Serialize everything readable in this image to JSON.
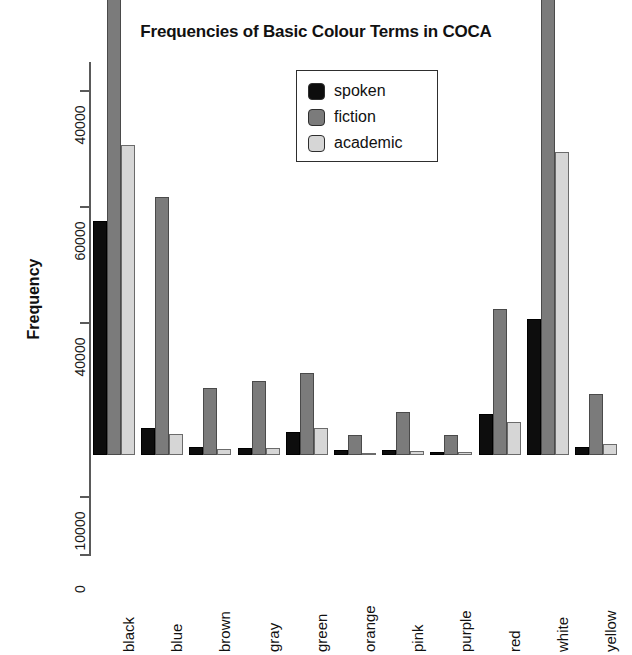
{
  "chart_data": {
    "type": "bar",
    "title": "Frequencies of Basic Colour Terms in COCA",
    "xlabel": "",
    "ylabel": "Frequency",
    "categories": [
      "black",
      "blue",
      "brown",
      "gray",
      "green",
      "orange",
      "pink",
      "purple",
      "red",
      "white",
      "yellow"
    ],
    "series": [
      {
        "name": "spoken",
        "color": "#0d0d0d",
        "values": [
          40300,
          4700,
          1300,
          1250,
          3900,
          900,
          950,
          550,
          7100,
          23500,
          1400
        ]
      },
      {
        "name": "fiction",
        "color": "#7b7b7b",
        "values": [
          82000,
          44500,
          11500,
          12700,
          14200,
          3500,
          7400,
          3400,
          25200,
          81000,
          10600
        ]
      },
      {
        "name": "academic",
        "color": "#d6d6d6",
        "values": [
          53500,
          3700,
          1100,
          1200,
          4600,
          350,
          650,
          450,
          5700,
          52200,
          1900
        ]
      }
    ],
    "ytick_labels": [
      "0",
      "10000",
      "40000",
      "60000",
      "40000"
    ],
    "ytick_values": [
      0,
      10000,
      40000,
      60000,
      80000
    ],
    "ylim": [
      0,
      85000
    ],
    "grid": false,
    "legend_position": "top-center",
    "legend_entries": [
      "spoken",
      "fiction",
      "academic"
    ]
  },
  "legend": {
    "items": [
      {
        "label": "spoken",
        "swatch": "spoken-swatch"
      },
      {
        "label": "fiction",
        "swatch": "fiction-swatch"
      },
      {
        "label": "academic",
        "swatch": "academic-swatch"
      }
    ]
  },
  "colors": {
    "spoken": "#0d0d0d",
    "fiction": "#7b7b7b",
    "academic": "#d6d6d6",
    "axis": "#5a5a5a",
    "text": "#111111",
    "background": "#ffffff"
  }
}
